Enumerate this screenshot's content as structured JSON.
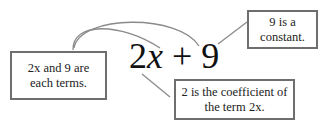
{
  "expression": {
    "coefficient": "2",
    "variable": "x",
    "operator": "+",
    "constant": "9"
  },
  "annotations": [
    {
      "id": "terms",
      "line1": "2x and 9 are",
      "line2": "each terms."
    },
    {
      "id": "constant",
      "line1": "9 is a",
      "line2": "constant."
    },
    {
      "id": "coefficient",
      "line1": "2 is the coefficient of",
      "line2": "the term 2x."
    }
  ],
  "colors": {
    "border": "#6e6e6e",
    "connector": "#8a8a8a",
    "text": "#1a1a1a"
  }
}
